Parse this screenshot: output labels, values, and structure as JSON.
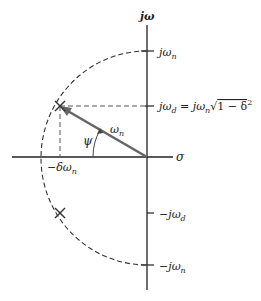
{
  "diagram": {
    "type": "s-plane pole location",
    "axes": {
      "imag_label": "jω",
      "real_label": "σ"
    },
    "tick_labels": {
      "jwn": "jωn",
      "jwd": "jωd = jωn√(1 − δ²)",
      "neg_jwd": "−jωd",
      "neg_jwn": "−jωn",
      "neg_delta_wn": "−δωn"
    },
    "vector_label": "ωn",
    "angle_label": "ψ",
    "poles": [
      {
        "name": "upper-pole",
        "symbol": "×"
      },
      {
        "name": "lower-pole",
        "symbol": "×"
      }
    ],
    "colors": {
      "axis": "#222222",
      "vector": "#666666",
      "dashed": "#333333"
    }
  }
}
